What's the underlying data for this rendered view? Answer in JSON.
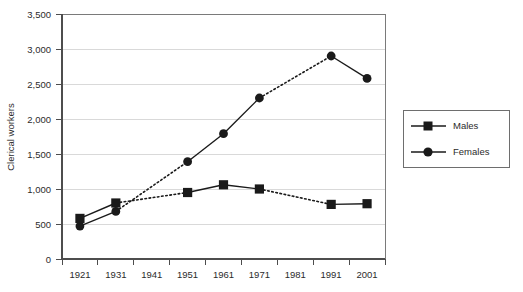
{
  "chart_data": {
    "type": "line",
    "title": "",
    "xlabel": "",
    "ylabel": "Clerical workers",
    "categories": [
      "1921",
      "1931",
      "1941",
      "1951",
      "1961",
      "1971",
      "1981",
      "1991",
      "2001"
    ],
    "ylim": [
      0,
      3500
    ],
    "ytick_labels": [
      "0",
      "500",
      "1,000",
      "1,500",
      "2,000",
      "2,500",
      "3,000",
      "3,500"
    ],
    "ytick_values": [
      0,
      500,
      1000,
      1500,
      2000,
      2500,
      3000,
      3500
    ],
    "grid": "horizontal",
    "legend_position": "right",
    "series": [
      {
        "name": "Males",
        "marker": "square",
        "color": "#1a1a1a",
        "values": [
          580,
          800,
          null,
          950,
          1060,
          1000,
          null,
          780,
          790
        ]
      },
      {
        "name": "Females",
        "marker": "circle",
        "color": "#1a1a1a",
        "values": [
          470,
          680,
          null,
          1390,
          1790,
          2300,
          null,
          2900,
          2580
        ]
      }
    ],
    "missing_note": "1941 and 1981 have no data; those gaps are drawn as dotted segments"
  },
  "axes": {
    "y_title": "Clerical workers",
    "y_ticks": [
      {
        "label": "3,500",
        "value": 3500
      },
      {
        "label": "3,000",
        "value": 3000
      },
      {
        "label": "2,500",
        "value": 2500
      },
      {
        "label": "2,000",
        "value": 2000
      },
      {
        "label": "1,500",
        "value": 1500
      },
      {
        "label": "1,000",
        "value": 1000
      },
      {
        "label": "500",
        "value": 500
      },
      {
        "label": "0",
        "value": 0
      }
    ],
    "x_ticks": [
      {
        "label": "1921"
      },
      {
        "label": "1931"
      },
      {
        "label": "1941"
      },
      {
        "label": "1951"
      },
      {
        "label": "1961"
      },
      {
        "label": "1971"
      },
      {
        "label": "1981"
      },
      {
        "label": "1991"
      },
      {
        "label": "2001"
      }
    ]
  },
  "legend": {
    "entries": [
      {
        "label": "Males",
        "marker": "square"
      },
      {
        "label": "Females",
        "marker": "circle"
      }
    ]
  },
  "colors": {
    "series": "#1a1a1a",
    "grid": "#d9d9d9",
    "axis": "#4d4d4d",
    "frame": "#7a7a7a",
    "background": "#ffffff"
  }
}
